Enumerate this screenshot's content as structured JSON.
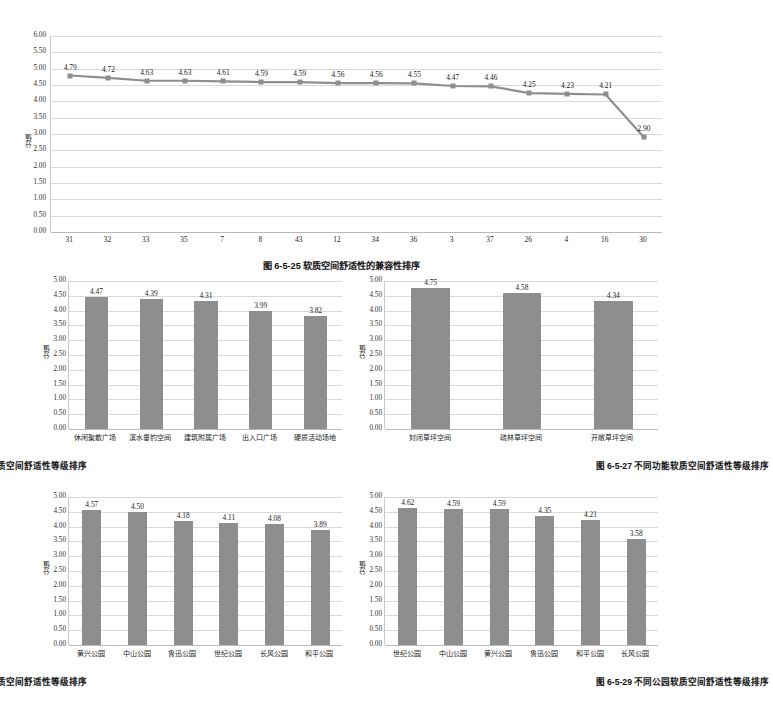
{
  "figures": [
    {
      "id": "fig-6-5-25",
      "caption": "图 6-5-25  软质空间舒适性的兼容性排序",
      "ylabel": "分值",
      "chart_data": {
        "type": "line",
        "title": "图 6-5-25 软质空间舒适性的兼容性排序",
        "xlabel": "",
        "ylabel": "分值",
        "ylim": [
          0,
          6
        ],
        "ytick_step": 0.5,
        "yticks": [
          "0.00",
          "0.50",
          "1.00",
          "1.50",
          "2.00",
          "2.50",
          "3.00",
          "3.50",
          "4.00",
          "4.50",
          "5.00",
          "5.50",
          "6.00"
        ],
        "grid": true,
        "legend": "none",
        "categories": [
          "31",
          "32",
          "33",
          "35",
          "7",
          "8",
          "43",
          "12",
          "34",
          "36",
          "3",
          "37",
          "26",
          "4",
          "16",
          "30"
        ],
        "values": [
          4.79,
          4.72,
          4.63,
          4.63,
          4.61,
          4.59,
          4.59,
          4.56,
          4.56,
          4.55,
          4.47,
          4.46,
          4.25,
          4.23,
          4.21,
          2.9
        ],
        "value_labels": [
          "4.79",
          "4.72",
          "4.63",
          "4.63",
          "4.61",
          "4.59",
          "4.59",
          "4.56",
          "4.56",
          "4.55",
          "4.47",
          "4.46",
          "4.25",
          "4.23",
          "4.21",
          "2.90"
        ],
        "series_color": "#8e8e8e"
      }
    },
    {
      "id": "fig-6-5-26",
      "caption": "图 6-5-26  不同功能硬质空间舒适性等级排序",
      "ylabel": "分值",
      "chart_data": {
        "type": "bar",
        "title": "图 6-5-26 不同功能硬质空间舒适性等级排序",
        "xlabel": "",
        "ylabel": "分值",
        "ylim": [
          0,
          5
        ],
        "ytick_step": 0.5,
        "yticks": [
          "0.00",
          "0.50",
          "1.00",
          "1.50",
          "2.00",
          "2.50",
          "3.00",
          "3.50",
          "4.00",
          "4.50",
          "5.00"
        ],
        "grid": true,
        "legend": "none",
        "categories": [
          "休闲聚散广场",
          "滨水垂钓空间",
          "建筑附属广场",
          "出入口广场",
          "硬质活动场地"
        ],
        "values": [
          4.47,
          4.39,
          4.31,
          3.99,
          3.82
        ],
        "value_labels": [
          "4.47",
          "4.39",
          "4.31",
          "3.99",
          "3.82"
        ],
        "series_color": "#8e8e8e"
      }
    },
    {
      "id": "fig-6-5-27",
      "caption": "图 6-5-27  不同功能软质空间舒适性等级排序",
      "ylabel": "分值",
      "chart_data": {
        "type": "bar",
        "title": "图 6-5-27 不同功能软质空间舒适性等级排序",
        "xlabel": "",
        "ylabel": "分值",
        "ylim": [
          0,
          5
        ],
        "ytick_step": 0.5,
        "yticks": [
          "0.00",
          "0.50",
          "1.00",
          "1.50",
          "2.00",
          "2.50",
          "3.00",
          "3.50",
          "4.00",
          "4.50",
          "5.00"
        ],
        "grid": true,
        "legend": "none",
        "categories": [
          "封闭草坪空间",
          "疏林草坪空间",
          "开敞草坪空间"
        ],
        "values": [
          4.75,
          4.58,
          4.34
        ],
        "value_labels": [
          "4.75",
          "4.58",
          "4.34"
        ],
        "series_color": "#8e8e8e"
      }
    },
    {
      "id": "fig-6-5-28",
      "caption": "图 6-5-28  不同公园硬质空间舒适性等级排序",
      "ylabel": "分值",
      "chart_data": {
        "type": "bar",
        "title": "图 6-5-28 不同公园硬质空间舒适性等级排序",
        "xlabel": "",
        "ylabel": "分值",
        "ylim": [
          0,
          5
        ],
        "ytick_step": 0.5,
        "yticks": [
          "0.00",
          "0.50",
          "1.00",
          "1.50",
          "2.00",
          "2.50",
          "3.00",
          "3.50",
          "4.00",
          "4.50",
          "5.00"
        ],
        "grid": true,
        "legend": "none",
        "categories": [
          "黄兴公园",
          "中山公园",
          "鲁迅公园",
          "世纪公园",
          "长风公园",
          "和平公园"
        ],
        "values": [
          4.57,
          4.5,
          4.18,
          4.11,
          4.08,
          3.89
        ],
        "value_labels": [
          "4.57",
          "4.50",
          "4.18",
          "4.11",
          "4.08",
          "3.89"
        ],
        "series_color": "#8e8e8e"
      }
    },
    {
      "id": "fig-6-5-29",
      "caption": "图 6-5-29  不同公园软质空间舒适性等级排序",
      "ylabel": "分值",
      "chart_data": {
        "type": "bar",
        "title": "图 6-5-29 不同公园软质空间舒适性等级排序",
        "xlabel": "",
        "ylabel": "分值",
        "ylim": [
          0,
          5
        ],
        "ytick_step": 0.5,
        "yticks": [
          "0.00",
          "0.50",
          "1.00",
          "1.50",
          "2.00",
          "2.50",
          "3.00",
          "3.50",
          "4.00",
          "4.50",
          "5.00"
        ],
        "grid": true,
        "legend": "none",
        "categories": [
          "世纪公园",
          "中山公园",
          "黄兴公园",
          "鲁迅公园",
          "和平公园",
          "长风公园"
        ],
        "values": [
          4.62,
          4.59,
          4.59,
          4.35,
          4.21,
          3.58
        ],
        "value_labels": [
          "4.62",
          "4.59",
          "4.59",
          "4.35",
          "4.21",
          "3.58"
        ],
        "series_color": "#8e8e8e"
      }
    }
  ]
}
